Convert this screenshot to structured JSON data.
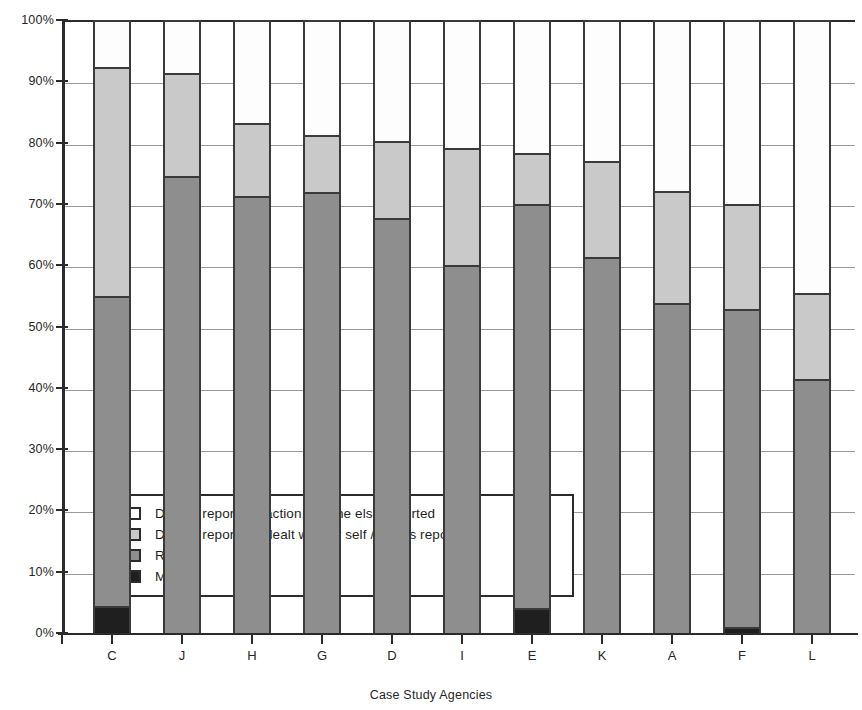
{
  "chart_data": {
    "type": "bar",
    "subtype": "stacked-100-percent",
    "title": "",
    "xlabel": "Case Study Agencies",
    "ylabel": "",
    "categories": [
      "C",
      "J",
      "H",
      "G",
      "D",
      "I",
      "E",
      "K",
      "A",
      "F",
      "L"
    ],
    "ylim": [
      0,
      100
    ],
    "ytick_labels": [
      "0%",
      "10%",
      "20%",
      "30%",
      "40%",
      "50%",
      "60%",
      "70%",
      "80%",
      "90%",
      "100%"
    ],
    "ytick_values": [
      0,
      10,
      20,
      30,
      40,
      50,
      60,
      70,
      80,
      90,
      100
    ],
    "grid": true,
    "legend_position": "inside-lower-left",
    "series": [
      {
        "name": "Did not report, no action, no one else reported",
        "color": "#fdfdfd",
        "values": [
          7.7,
          8.7,
          16.8,
          18.7,
          19.8,
          20.8,
          21.7,
          23.0,
          27.9,
          30.0,
          44.6
        ]
      },
      {
        "name": "Did not report but dealt with by self / others reported",
        "color": "#c9c9c9",
        "values": [
          37.3,
          16.8,
          11.9,
          9.3,
          12.5,
          19.2,
          8.3,
          15.6,
          18.2,
          17.2,
          14.0
        ]
      },
      {
        "name": "Report",
        "color": "#8e8e8e",
        "values": [
          50.6,
          74.5,
          71.3,
          72.0,
          67.7,
          60.0,
          66.0,
          61.4,
          53.9,
          51.8,
          41.4
        ]
      },
      {
        "name": "Missing",
        "color": "#1f1f1f",
        "values": [
          4.4,
          0,
          0,
          0,
          0,
          0,
          4.0,
          0,
          0,
          1.0,
          0
        ]
      }
    ]
  },
  "legend": {
    "items": [
      {
        "label": "Did not report, no action, no one else reported",
        "swatch": "#fdfdfd"
      },
      {
        "label": "Did not report but dealt with by self / others reported",
        "swatch": "#c9c9c9"
      },
      {
        "label": "Report",
        "swatch": "#8e8e8e"
      },
      {
        "label": "Missing",
        "swatch": "#1f1f1f"
      }
    ]
  }
}
